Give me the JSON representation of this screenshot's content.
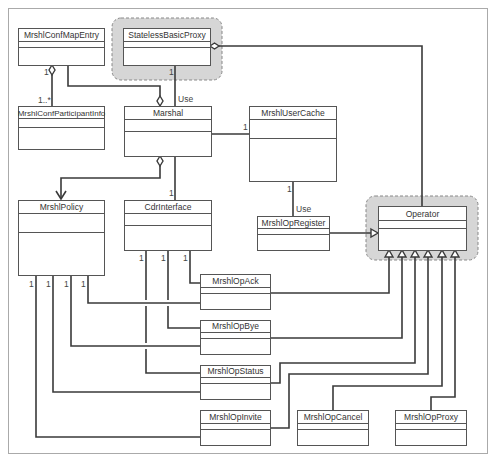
{
  "diagram": {
    "type": "UML class diagram",
    "classes": {
      "conf_map_entry": {
        "name": "MrshlConfMapEntry"
      },
      "stateless_basic_proxy": {
        "name": "StatelessBasicProxy",
        "highlighted": true
      },
      "conf_participant_info": {
        "name": "MrshlConfParticipantInfo"
      },
      "marshal": {
        "name": "Marshal"
      },
      "user_cache": {
        "name": "MrshlUserCache"
      },
      "policy": {
        "name": "MrshlPolicy"
      },
      "cdr_interface": {
        "name": "CdrInterface"
      },
      "op_register": {
        "name": "MrshlOpRegister"
      },
      "operator": {
        "name": "Operator",
        "highlighted": true
      },
      "op_ack": {
        "name": "MrshlOpAck"
      },
      "op_bye": {
        "name": "MrshlOpBye"
      },
      "op_status": {
        "name": "MrshlOpStatus"
      },
      "op_invite": {
        "name": "MrshlOpInvite"
      },
      "op_cancel": {
        "name": "MrshlOpCancel"
      },
      "op_proxy": {
        "name": "MrshlOpProxy"
      }
    },
    "labels": {
      "use_marshal": "Use",
      "use_register": "Use",
      "mult_confmap_1": "1",
      "mult_participant_many": "1..*",
      "mult_stateless_1": "1",
      "mult_usercache_1": "1",
      "mult_usercache_bottom_1": "1",
      "mult_cdr_top_1": "1",
      "mult_policy_a": "1",
      "mult_policy_b": "1",
      "mult_policy_c": "1",
      "mult_policy_d": "1",
      "mult_cdr_a": "1",
      "mult_cdr_b": "1",
      "mult_cdr_c": "1"
    },
    "relationships": [
      {
        "from": "MrshlConfParticipantInfo",
        "to": "MrshlConfMapEntry",
        "kind": "aggregation",
        "multiplicity": [
          "1..*",
          "1"
        ]
      },
      {
        "from": "MrshlConfMapEntry",
        "to": "Marshal",
        "kind": "aggregation"
      },
      {
        "from": "Marshal",
        "to": "StatelessBasicProxy",
        "kind": "association",
        "label": "Use",
        "multiplicity": "1"
      },
      {
        "from": "Operator",
        "to": "StatelessBasicProxy",
        "kind": "aggregation"
      },
      {
        "from": "Marshal",
        "to": "MrshlUserCache",
        "kind": "association",
        "multiplicity": "1"
      },
      {
        "from": "Marshal",
        "to": "MrshlPolicy",
        "kind": "aggregation-navigable"
      },
      {
        "from": "Marshal",
        "to": "CdrInterface",
        "kind": "association",
        "multiplicity": "1"
      },
      {
        "from": "MrshlOpRegister",
        "to": "MrshlUserCache",
        "kind": "association",
        "label": "Use",
        "multiplicity": "1"
      },
      {
        "from": "MrshlOpRegister",
        "to": "Operator",
        "kind": "generalization"
      },
      {
        "from": "MrshlOpAck",
        "to": "Operator",
        "kind": "generalization"
      },
      {
        "from": "MrshlOpBye",
        "to": "Operator",
        "kind": "generalization"
      },
      {
        "from": "MrshlOpStatus",
        "to": "Operator",
        "kind": "generalization"
      },
      {
        "from": "MrshlOpInvite",
        "to": "Operator",
        "kind": "generalization"
      },
      {
        "from": "MrshlOpCancel",
        "to": "Operator",
        "kind": "generalization"
      },
      {
        "from": "MrshlOpProxy",
        "to": "Operator",
        "kind": "generalization"
      }
    ],
    "colors": {
      "highlight_fill": "#d6d6d6",
      "line": "#3a3a3a",
      "box_border": "#555555"
    }
  }
}
